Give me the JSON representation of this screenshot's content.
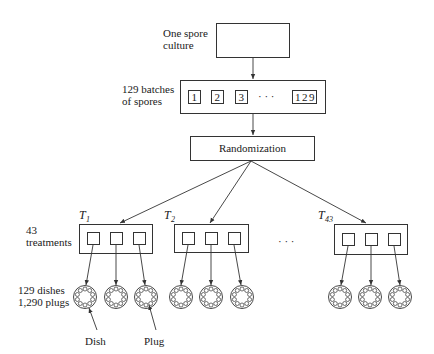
{
  "diagram": {
    "top": {
      "label_line1": "One spore",
      "label_line2": "culture"
    },
    "batches": {
      "label_line1": "129 batches",
      "label_line2": "of spores",
      "items": [
        "1",
        "2",
        "3",
        "129"
      ],
      "ellipsis": "·  ·  ·"
    },
    "randomization": {
      "label": "Randomization"
    },
    "treatments": {
      "label_line1": "43",
      "label_line2": "treatments",
      "groups": [
        {
          "name": "T",
          "sub": "1"
        },
        {
          "name": "T",
          "sub": "2"
        },
        {
          "name": "T",
          "sub": "43"
        }
      ],
      "ellipsis": "·   ·   ·"
    },
    "dishes": {
      "label_line1": "129 dishes",
      "label_line2": "1,290 plugs",
      "plugs_per_dish": 10
    },
    "callouts": {
      "dish": "Dish",
      "plug": "Plug"
    },
    "colors": {
      "stroke": "#333333",
      "text": "#1a1a1a",
      "background": "#ffffff"
    }
  }
}
